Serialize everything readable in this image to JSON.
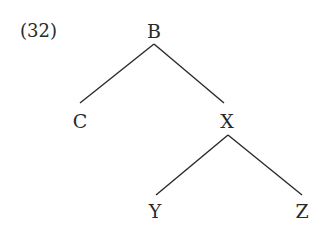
{
  "example_number": "(32)",
  "tree": {
    "nodes": [
      {
        "id": "B",
        "label": "B",
        "x": 154,
        "y": 31
      },
      {
        "id": "C",
        "label": "C",
        "x": 80,
        "y": 121
      },
      {
        "id": "X",
        "label": "X",
        "x": 227,
        "y": 121
      },
      {
        "id": "Y",
        "label": "Y",
        "x": 155,
        "y": 211
      },
      {
        "id": "Z",
        "label": "Z",
        "x": 302,
        "y": 211
      }
    ],
    "edges": [
      [
        "B",
        "C"
      ],
      [
        "B",
        "X"
      ],
      [
        "X",
        "Y"
      ],
      [
        "X",
        "Z"
      ]
    ]
  },
  "colors": {
    "ink": "#2a2a2a",
    "background": "#ffffff"
  }
}
